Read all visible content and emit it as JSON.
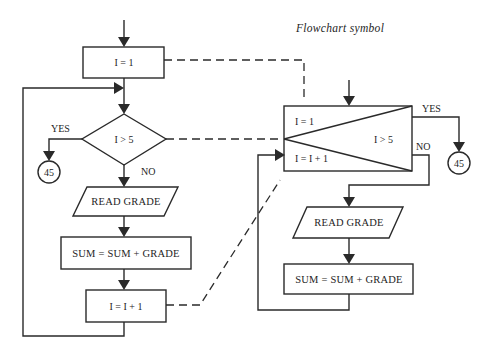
{
  "title": "Flowchart symbol",
  "left_flowchart": {
    "init_box": "I = 1",
    "decision": "I > 5",
    "yes_label": "YES",
    "no_label": "NO",
    "connector": "45",
    "input_box": "READ GRADE",
    "process_box": "SUM = SUM + GRADE",
    "increment_box": "I = I + 1"
  },
  "right_flowchart": {
    "loop_symbol": {
      "init": "I = 1",
      "test": "I > 5",
      "increment": "I = I + 1"
    },
    "yes_label": "YES",
    "no_label": "NO",
    "connector": "45",
    "input_box": "READ GRADE",
    "process_box": "SUM = SUM + GRADE"
  },
  "colors": {
    "line": "#2a2a2a",
    "background": "#ffffff"
  }
}
